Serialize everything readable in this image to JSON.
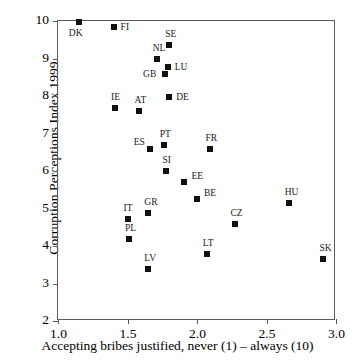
{
  "chart_data": {
    "type": "scatter",
    "title": "",
    "xlabel": "Accepting bribes justified, never (1) – always (10)",
    "ylabel": "Corruption Perceptions Index 1999",
    "xlim": [
      1.0,
      3.0
    ],
    "ylim": [
      2,
      10
    ],
    "xticks": [
      "1.0",
      "1.5",
      "2.0",
      "2.5",
      "3.0"
    ],
    "xtick_values": [
      1.0,
      1.5,
      2.0,
      2.5,
      3.0
    ],
    "yticks": [
      "2",
      "3",
      "4",
      "5",
      "6",
      "7",
      "8",
      "9",
      "10"
    ],
    "ytick_values": [
      2,
      3,
      4,
      5,
      6,
      7,
      8,
      9,
      10
    ],
    "grid": false,
    "legend": "none",
    "marker": "square",
    "marker_color": "#111111",
    "points": [
      {
        "label": "DK",
        "x": 1.15,
        "y": 9.97,
        "lx": -10,
        "ly": 6
      },
      {
        "label": "FI",
        "x": 1.4,
        "y": 9.83,
        "lx": 7,
        "ly": -5
      },
      {
        "label": "SE",
        "x": 1.8,
        "y": 9.37,
        "lx": -4,
        "ly": -16
      },
      {
        "label": "NL",
        "x": 1.71,
        "y": 9.0,
        "lx": -4,
        "ly": -16
      },
      {
        "label": "LU",
        "x": 1.79,
        "y": 8.77,
        "lx": 7,
        "ly": -5
      },
      {
        "label": "GB",
        "x": 1.77,
        "y": 8.58,
        "lx": -22,
        "ly": -5
      },
      {
        "label": "DE",
        "x": 1.8,
        "y": 7.98,
        "lx": 7,
        "ly": -5
      },
      {
        "label": "IE",
        "x": 1.41,
        "y": 7.68,
        "lx": -4,
        "ly": -16
      },
      {
        "label": "AT",
        "x": 1.58,
        "y": 7.6,
        "lx": -4,
        "ly": -16
      },
      {
        "label": "PT",
        "x": 1.76,
        "y": 6.7,
        "lx": -4,
        "ly": -16
      },
      {
        "label": "ES",
        "x": 1.66,
        "y": 6.59,
        "lx": -16,
        "ly": -12
      },
      {
        "label": "FR",
        "x": 2.09,
        "y": 6.58,
        "lx": -4,
        "ly": -16
      },
      {
        "label": "SI",
        "x": 1.78,
        "y": 6.0,
        "lx": -4,
        "ly": -16
      },
      {
        "label": "EE",
        "x": 1.91,
        "y": 5.72,
        "lx": 7,
        "ly": -11
      },
      {
        "label": "BE",
        "x": 2.0,
        "y": 5.26,
        "lx": 7,
        "ly": -11
      },
      {
        "label": "HU",
        "x": 2.66,
        "y": 5.15,
        "lx": -4,
        "ly": -16
      },
      {
        "label": "GR",
        "x": 1.65,
        "y": 4.88,
        "lx": -4,
        "ly": -16
      },
      {
        "label": "IT",
        "x": 1.5,
        "y": 4.72,
        "lx": -4,
        "ly": -16
      },
      {
        "label": "CZ",
        "x": 2.27,
        "y": 4.58,
        "lx": -4,
        "ly": -16
      },
      {
        "label": "PL",
        "x": 1.51,
        "y": 4.2,
        "lx": -4,
        "ly": -16
      },
      {
        "label": "LT",
        "x": 2.07,
        "y": 3.78,
        "lx": -4,
        "ly": -16
      },
      {
        "label": "SK",
        "x": 2.91,
        "y": 3.66,
        "lx": -4,
        "ly": -16
      },
      {
        "label": "LV",
        "x": 1.65,
        "y": 3.38,
        "lx": -4,
        "ly": -16
      }
    ]
  }
}
